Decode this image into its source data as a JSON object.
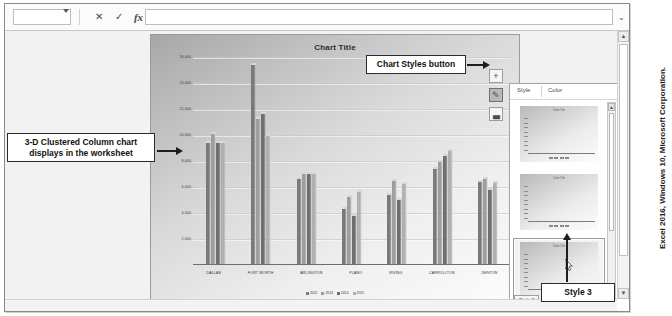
{
  "formula_bar": {
    "name_box_value": "",
    "name_box_caret": "▼",
    "cancel_label": "✕",
    "enter_label": "✓",
    "function_label": "fx",
    "formula_value": "",
    "expand_label": "⌄"
  },
  "chart": {
    "title": "Chart Title",
    "side_buttons": [
      {
        "name": "chart-elements",
        "glyph": "+",
        "active": false
      },
      {
        "name": "chart-styles",
        "glyph": "✎",
        "active": true
      },
      {
        "name": "chart-filters",
        "glyph": "▃",
        "active": false
      }
    ]
  },
  "chart_data": {
    "type": "bar",
    "title": "Chart Title",
    "xlabel": "",
    "ylabel": "",
    "ylim": [
      0,
      16000
    ],
    "yticks": [
      2000,
      4000,
      6000,
      8000,
      10000,
      12000,
      14000,
      16000
    ],
    "ytick_labels": [
      "2,000",
      "4,000",
      "6,000",
      "8,000",
      "10,000",
      "12,000",
      "14,000",
      "16,000"
    ],
    "grid": true,
    "legend_position": "bottom",
    "categories": [
      "DALLAS",
      "FORT WORTH",
      "ARLINGTON",
      "PLANO",
      "IRVING",
      "CARROLLTON",
      "DENTON"
    ],
    "series": [
      {
        "name": "2012",
        "color": "#7a7a7a",
        "values": [
          9400,
          15400,
          6600,
          4300,
          5400,
          7400,
          6400
        ]
      },
      {
        "name": "2013",
        "color": "#9e9e9e",
        "values": [
          10100,
          11200,
          7000,
          5200,
          6500,
          7900,
          6600
        ]
      },
      {
        "name": "2014",
        "color": "#6f6f6f",
        "values": [
          9400,
          11600,
          7000,
          3800,
          5000,
          8400,
          5800
        ]
      },
      {
        "name": "2015",
        "color": "#b0b0b0",
        "values": [
          9400,
          9900,
          7000,
          5600,
          6200,
          8800,
          6300
        ]
      }
    ]
  },
  "gallery": {
    "tabs": [
      {
        "label": "Style",
        "selected": true
      },
      {
        "label": "Color",
        "selected": false
      }
    ],
    "thumbnails": [
      {
        "name": "style-1",
        "selected": false
      },
      {
        "name": "style-2",
        "selected": false
      },
      {
        "name": "style-3",
        "selected": true
      }
    ],
    "tooltip": "Style 3",
    "scroll_up": "▲",
    "scroll_down": "▼"
  },
  "scrollbars": {
    "v_up": "▲",
    "v_down": "▼"
  },
  "callouts": {
    "chart_in_worksheet": "3-D Clustered Column chart displays in the worksheet",
    "chart_styles_button": "Chart Styles button",
    "style_three": "Style 3"
  },
  "credit": "Excel 2016, Windows 10, Microsoft Corporation."
}
